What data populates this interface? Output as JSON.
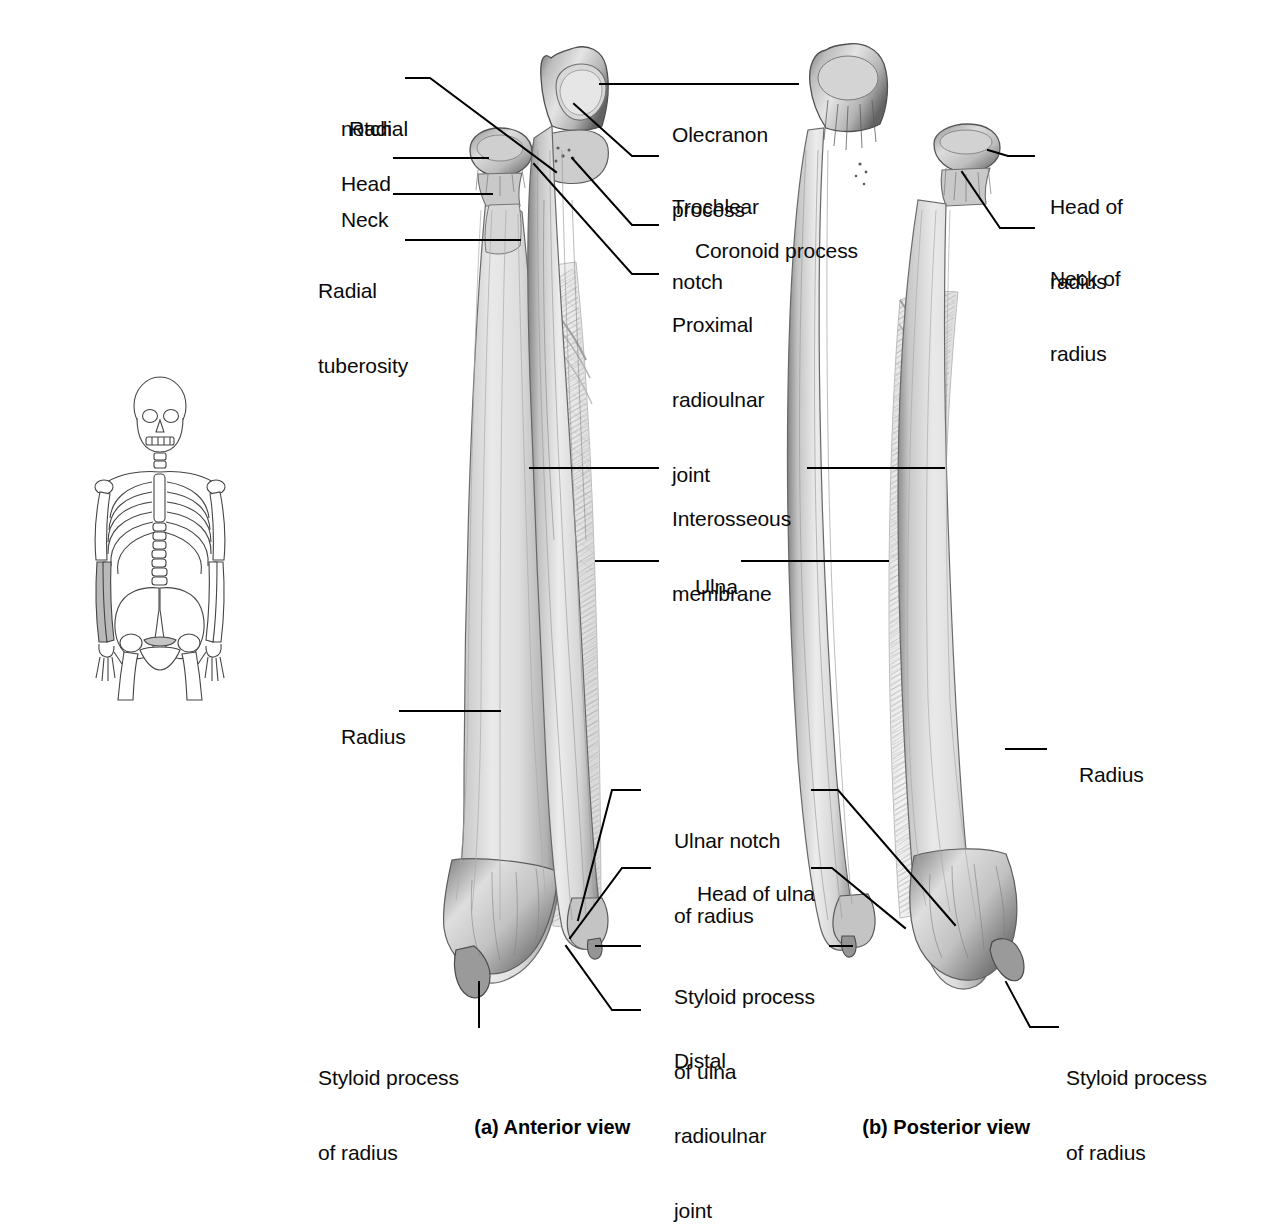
{
  "figure": {
    "background_color": "#ffffff",
    "ink_color": "#000000"
  },
  "orientation_figure": {
    "name": "skeleton-orientation-diagram",
    "description": "Anterior whole-body skeleton with both forearms shaded to indicate region shown",
    "highlight_color": "#b9b9b9",
    "outline_color": "#3a3a3a"
  },
  "panels": [
    {
      "id": "a",
      "caption": "(a) Anterior view"
    },
    {
      "id": "b",
      "caption": "(b) Posterior view"
    }
  ],
  "captions": {
    "anterior": "(a) Anterior view",
    "posterior": "(b) Posterior view"
  },
  "labels": {
    "anterior_left": [
      {
        "key": "radial_notch",
        "lines": [
          "Radial",
          "notch"
        ]
      },
      {
        "key": "head",
        "lines": [
          "Head"
        ]
      },
      {
        "key": "neck",
        "lines": [
          "Neck"
        ]
      },
      {
        "key": "radial_tuberosity",
        "lines": [
          "Radial",
          "tuberosity"
        ]
      },
      {
        "key": "radius",
        "lines": [
          "Radius"
        ]
      },
      {
        "key": "styloid_process_of_radius",
        "lines": [
          "Styloid process",
          "of radius"
        ]
      }
    ],
    "anterior_right": [
      {
        "key": "olecranon_process",
        "lines": [
          "Olecranon",
          "process"
        ]
      },
      {
        "key": "trochlear_notch",
        "lines": [
          "Trochlear",
          "notch"
        ]
      },
      {
        "key": "coronoid_process",
        "lines": [
          "Coronoid process"
        ]
      },
      {
        "key": "proximal_radioulnar_joint",
        "lines": [
          "Proximal",
          "radioulnar",
          "joint"
        ]
      }
    ],
    "center": [
      {
        "key": "interosseous_membrane",
        "lines": [
          "Interosseous",
          "membrane"
        ]
      },
      {
        "key": "ulna",
        "lines": [
          "Ulna"
        ]
      },
      {
        "key": "ulnar_notch_of_radius",
        "lines": [
          "Ulnar notch",
          "of radius"
        ]
      },
      {
        "key": "head_of_ulna",
        "lines": [
          "Head of ulna"
        ]
      },
      {
        "key": "styloid_process_of_ulna",
        "lines": [
          "Styloid process",
          "of ulna"
        ]
      },
      {
        "key": "distal_radioulnar_joint",
        "lines": [
          "Distal",
          "radioulnar",
          "joint"
        ]
      }
    ],
    "posterior_right": [
      {
        "key": "head_of_radius",
        "lines": [
          "Head of",
          "radius"
        ]
      },
      {
        "key": "neck_of_radius",
        "lines": [
          "Neck of",
          "radius"
        ]
      },
      {
        "key": "radius_posterior",
        "lines": [
          "Radius"
        ]
      },
      {
        "key": "styloid_process_of_radius_posterior",
        "lines": [
          "Styloid process",
          "of radius"
        ]
      }
    ]
  },
  "text": {
    "radial_notch_l1": "Radial",
    "radial_notch_l2": "notch",
    "head": "Head",
    "neck": "Neck",
    "radial_tuberosity_l1": "Radial",
    "radial_tuberosity_l2": "tuberosity",
    "radius_left": "Radius",
    "styloid_radius_left_l1": "Styloid process",
    "styloid_radius_left_l2": "of radius",
    "olecranon_l1": "Olecranon",
    "olecranon_l2": "process",
    "trochlear_l1": "Trochlear",
    "trochlear_l2": "notch",
    "coronoid": "Coronoid process",
    "proximal_ruj_l1": "Proximal",
    "proximal_ruj_l2": "radioulnar",
    "proximal_ruj_l3": "joint",
    "interosseous_l1": "Interosseous",
    "interosseous_l2": "membrane",
    "ulna": "Ulna",
    "ulnar_notch_l1": "Ulnar notch",
    "ulnar_notch_l2": "of radius",
    "head_of_ulna": "Head of ulna",
    "styloid_ulna_l1": "Styloid process",
    "styloid_ulna_l2": "of ulna",
    "distal_ruj_l1": "Distal",
    "distal_ruj_l2": "radioulnar",
    "distal_ruj_l3": "joint",
    "head_of_radius_l1": "Head of",
    "head_of_radius_l2": "radius",
    "neck_of_radius_l1": "Neck of",
    "neck_of_radius_l2": "radius",
    "radius_right": "Radius",
    "styloid_radius_right_l1": "Styloid process",
    "styloid_radius_right_l2": "of radius",
    "caption_a": "(a) Anterior view",
    "caption_b": "(b) Posterior view"
  }
}
